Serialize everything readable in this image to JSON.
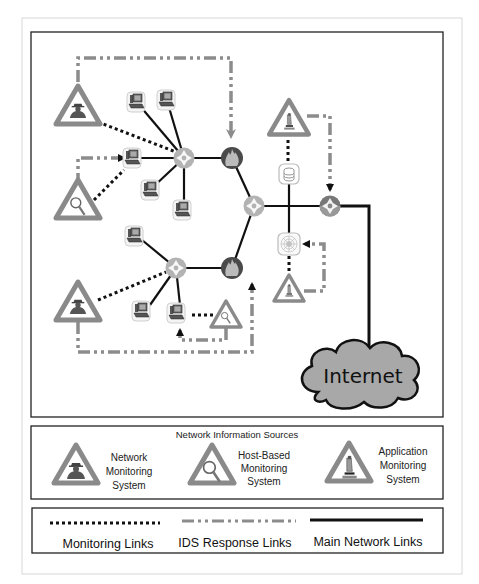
{
  "diagram": {
    "main": {
      "cloud_label": "Internet",
      "nodes": {
        "routers": [
          "router-left-upper",
          "router-center",
          "router-left-lower",
          "router-right"
        ],
        "firewalls": [
          "firewall-upper",
          "firewall-lower"
        ],
        "workstations_upper": 5,
        "workstations_lower": 3,
        "server_database": "database-server",
        "server_web": "web-server",
        "network_monitors": [
          "nms-upper-left",
          "nms-lower-left"
        ],
        "host_monitors": [
          "hbms-left",
          "hbms-lower"
        ],
        "app_monitors": [
          "ams-upper-right",
          "ams-lower-right"
        ]
      }
    },
    "sources_box": {
      "title": "Network Information Sources",
      "items": [
        {
          "icon": "spy-icon",
          "lines": [
            "Network",
            "Monitoring",
            "System"
          ]
        },
        {
          "icon": "magnifier-icon",
          "lines": [
            "Host-Based",
            "Monitoring",
            "System"
          ]
        },
        {
          "icon": "microscope-icon",
          "lines": [
            "Application",
            "Monitoring",
            "System"
          ]
        }
      ]
    },
    "links_legend": {
      "items": [
        {
          "style": "dotted",
          "label": "Monitoring Links"
        },
        {
          "style": "dash-dot",
          "label": "IDS Response Links"
        },
        {
          "style": "solid",
          "label": "Main Network Links"
        }
      ]
    },
    "colors": {
      "triangle": "#8a8a8a",
      "router": "#b0b0b0",
      "firewall": "#4a4a4a",
      "cloud": "#a8a8a8",
      "response_link": "#8c8c8c",
      "monitor_link": "#111111",
      "main_link": "#111111"
    }
  }
}
